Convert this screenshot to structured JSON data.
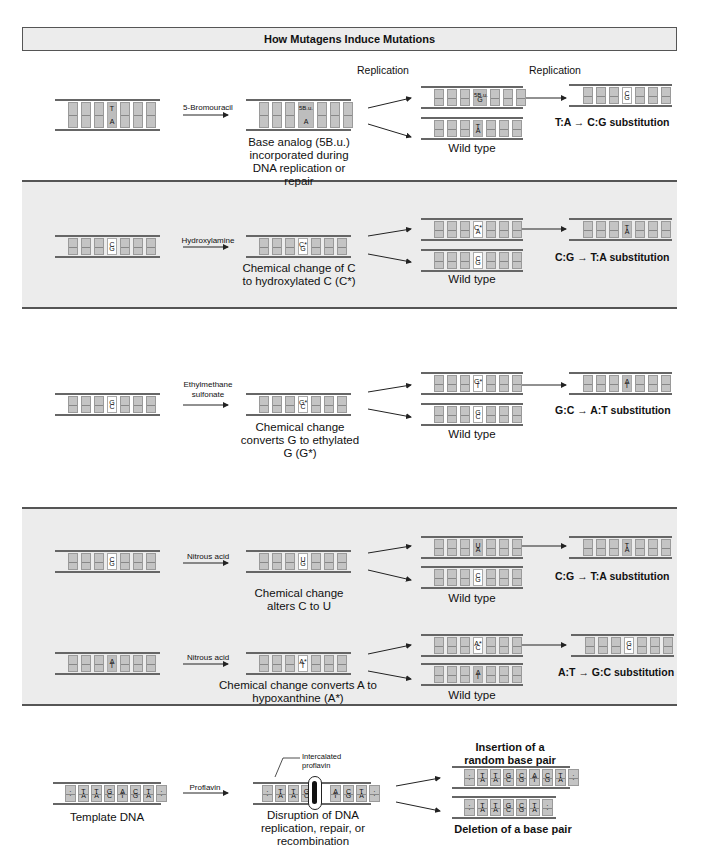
{
  "title": "How Mutagens Induce Mutations",
  "replication_label": "Replication",
  "wild_type_label": "Wild type",
  "sections": [
    {
      "mutagen": "5-Bromouracil",
      "original_pair": [
        "T",
        "A"
      ],
      "modified_pair": [
        "5B.u.",
        "A"
      ],
      "caption": "Base analog (5B.u.) incorporated during DNA replication or repair",
      "mutant_pair": [
        "5B.u.",
        "G"
      ],
      "wild_pair": [
        "T",
        "A"
      ],
      "final_pair": [
        "C",
        "G"
      ],
      "result": "T:A → C:G substitution"
    },
    {
      "mutagen": "Hydroxylamine",
      "original_pair": [
        "C",
        "G"
      ],
      "modified_pair": [
        "C*",
        "G"
      ],
      "caption": "Chemical change of C to hydroxylated C (C*)",
      "mutant_pair": [
        "C*",
        "A"
      ],
      "wild_pair": [
        "C",
        "G"
      ],
      "final_pair": [
        "T",
        "A"
      ],
      "result": "C:G → T:A substitution"
    },
    {
      "mutagen": "Ethylmethane sulfonate",
      "original_pair": [
        "G",
        "C"
      ],
      "modified_pair": [
        "G*",
        "C"
      ],
      "caption": "Chemical change converts G to ethylated G (G*)",
      "mutant_pair": [
        "G*",
        "T"
      ],
      "wild_pair": [
        "G",
        "C"
      ],
      "final_pair": [
        "A",
        "T"
      ],
      "result": "G:C → A:T substitution"
    },
    {
      "mutagen": "Nitrous acid",
      "original_pair": [
        "C",
        "G"
      ],
      "modified_pair": [
        "U",
        "G"
      ],
      "caption": "Chemical change alters C to U",
      "mutant_pair": [
        "U",
        "A"
      ],
      "wild_pair": [
        "C",
        "G"
      ],
      "final_pair": [
        "T",
        "A"
      ],
      "result": "C:G → T:A substitution"
    },
    {
      "mutagen": "Nitrous acid",
      "original_pair": [
        "A",
        "T"
      ],
      "modified_pair": [
        "A*",
        "T"
      ],
      "caption": "Chemical change converts A to hypoxanthine (A*)",
      "mutant_pair": [
        "A*",
        "C"
      ],
      "wild_pair": [
        "A",
        "T"
      ],
      "final_pair": [
        "G",
        "C"
      ],
      "result": "A:T → G:C substitution"
    }
  ],
  "frameshift": {
    "mutagen": "Proflavin",
    "template_top": [
      "·",
      "T",
      "T",
      "G",
      "A",
      "C",
      "T",
      "·"
    ],
    "template_bottom": [
      "·",
      "A",
      "A",
      "C",
      "T",
      "G",
      "A",
      "·"
    ],
    "template_caption": "Template DNA",
    "intercalated_label": "Intercalated proflavin",
    "disruption_caption": "Disruption of DNA replication, repair, or recombination",
    "insertion_title": "Insertion of a random base pair",
    "insertion_top": [
      "·",
      "T",
      "T",
      "G",
      "C",
      "A",
      "C",
      "T",
      "·"
    ],
    "insertion_bottom": [
      "·",
      "A",
      "A",
      "C",
      "G",
      "T",
      "G",
      "A",
      "·"
    ],
    "deletion_title": "Deletion of a base pair",
    "deletion_top": [
      "·",
      "T",
      "T",
      "G",
      "C",
      "T",
      "·"
    ],
    "deletion_bottom": [
      "·",
      "A",
      "A",
      "C",
      "G",
      "A",
      "·"
    ]
  }
}
